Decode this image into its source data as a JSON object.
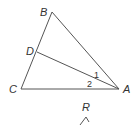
{
  "diagram": {
    "type": "geometry-triangle",
    "points": {
      "A": {
        "label": "A",
        "x": 119,
        "y": 89
      },
      "B": {
        "label": "B",
        "x": 52,
        "y": 12
      },
      "C": {
        "label": "C",
        "x": 21,
        "y": 89
      },
      "D": {
        "label": "D",
        "x": 37,
        "y": 52
      }
    },
    "segments": [
      "AB",
      "BC",
      "CA",
      "AD"
    ],
    "angles": [
      {
        "label": "1",
        "between": "BAD"
      },
      {
        "label": "2",
        "between": "DAC"
      }
    ],
    "partial_figure": {
      "label": "R",
      "vertex": {
        "x": 86,
        "y": 117
      }
    }
  }
}
